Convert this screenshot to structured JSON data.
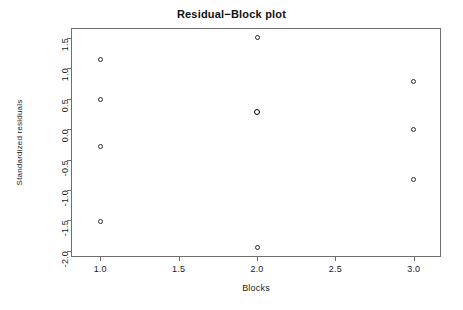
{
  "chart_data": {
    "type": "scatter",
    "title": "Residual−Block plot",
    "xlabel": "Blocks",
    "ylabel": "Standardized residuals",
    "xlim": [
      0.82,
      3.18
    ],
    "ylim": [
      -2.12,
      1.65
    ],
    "grid": false,
    "legend": null,
    "xticks": [
      "1.0",
      "1.5",
      "2.0",
      "2.5",
      "3.0"
    ],
    "xtick_values": [
      1.0,
      1.5,
      2.0,
      2.5,
      3.0
    ],
    "yticks": [
      "1.5",
      "1.0",
      "0.5",
      "0.0",
      "-0.5",
      "-1.0",
      "-1.5",
      "-2.0"
    ],
    "ytick_values": [
      1.5,
      1.0,
      0.5,
      0.0,
      -0.5,
      -1.0,
      -1.5,
      -2.0
    ],
    "marker": "open-circle",
    "marker_color": "#2b2b2b",
    "points": [
      {
        "x": 1.0,
        "y": 1.15,
        "overplotted": false
      },
      {
        "x": 1.0,
        "y": 0.49,
        "overplotted": false
      },
      {
        "x": 1.0,
        "y": -0.29,
        "overplotted": false
      },
      {
        "x": 1.0,
        "y": -1.52,
        "overplotted": false
      },
      {
        "x": 2.0,
        "y": 1.51,
        "overplotted": false
      },
      {
        "x": 2.0,
        "y": 0.29,
        "overplotted": true
      },
      {
        "x": 2.0,
        "y": -1.95,
        "overplotted": false
      },
      {
        "x": 3.0,
        "y": 0.79,
        "overplotted": false
      },
      {
        "x": 3.0,
        "y": -0.01,
        "overplotted": false
      },
      {
        "x": 3.0,
        "y": -0.82,
        "overplotted": false
      }
    ]
  }
}
